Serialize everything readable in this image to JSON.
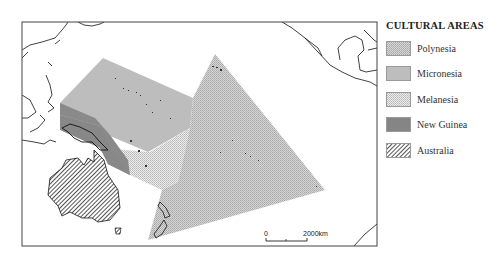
{
  "legend": {
    "title": "CULTURAL AREAS",
    "items": [
      {
        "label": "Polynesia",
        "pattern": "dots-light",
        "color": "#c8c8c8"
      },
      {
        "label": "Micronesia",
        "pattern": "solid-light",
        "color": "#bdbdbd"
      },
      {
        "label": "Melanesia",
        "pattern": "dots-sparse",
        "color": "#e0e0e0"
      },
      {
        "label": "New Guinea",
        "pattern": "solid-dark",
        "color": "#858585"
      },
      {
        "label": "Australia",
        "pattern": "diagonal-hatch",
        "color": "#ffffff"
      }
    ]
  },
  "scale_bar": {
    "start_label": "0",
    "end_label": "2000km"
  },
  "map": {
    "frame_color": "#444444",
    "coastline_color": "#111111"
  }
}
